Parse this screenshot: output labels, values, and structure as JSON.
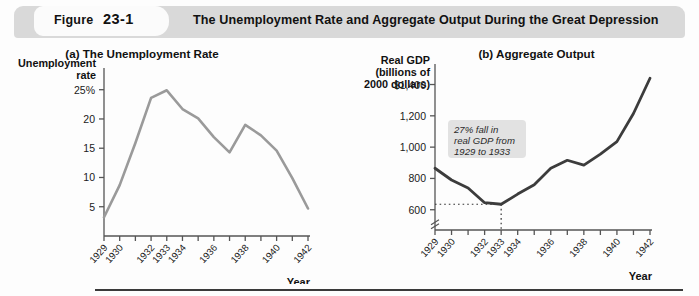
{
  "header": {
    "figure_label": "Figure",
    "figure_number": "23-1",
    "title": "The Unemployment Rate and Aggregate Output During the Great Depression"
  },
  "panel_a": {
    "title": "(a) The Unemployment Rate",
    "y_axis_title_line1": "Unemployment",
    "y_axis_title_line2": "rate",
    "x_axis_title": "Year"
  },
  "panel_b": {
    "title": "(b) Aggregate Output",
    "y_axis_title_line1": "Real GDP",
    "y_axis_title_line2": "(billions of",
    "y_axis_title_line3": "2000 dollars)",
    "x_axis_title": "Year",
    "annotation_line1": "27% fall in",
    "annotation_line2": "real GDP from",
    "annotation_line3": "1929 to 1933"
  },
  "colors": {
    "header_bar": "#d9d9d9",
    "unemployment_line": "#9a9a9a",
    "gdp_line": "#3c3c3c",
    "annotation_box": "#e2e2e2",
    "axis": "#555555",
    "rule": "#3a3a3a"
  },
  "chart_data": [
    {
      "type": "line",
      "id": "unemployment-rate",
      "title": "(a) The Unemployment Rate",
      "xlabel": "Year",
      "ylabel": "Unemployment rate",
      "x": [
        1929,
        1930,
        1931,
        1932,
        1933,
        1934,
        1935,
        1936,
        1937,
        1938,
        1939,
        1940,
        1941,
        1942
      ],
      "values": [
        3.2,
        8.7,
        15.9,
        23.6,
        24.9,
        21.7,
        20.1,
        16.9,
        14.3,
        19.0,
        17.2,
        14.6,
        9.9,
        4.7
      ],
      "ytick_labels": [
        "25%",
        "20",
        "15",
        "10",
        "5"
      ],
      "yticks": [
        25,
        20,
        15,
        10,
        5
      ],
      "ylim": [
        0,
        27
      ],
      "xtick_labels": [
        "1929",
        "1930",
        "1932",
        "1933",
        "1934",
        "1936",
        "1938",
        "1940",
        "1942"
      ],
      "xticks": [
        1929,
        1930,
        1932,
        1933,
        1934,
        1936,
        1938,
        1940,
        1942
      ],
      "grid": false,
      "legend": "none"
    },
    {
      "type": "line",
      "id": "aggregate-output",
      "title": "(b) Aggregate Output",
      "xlabel": "Year",
      "ylabel": "Real GDP (billions of 2000 dollars)",
      "x": [
        1929,
        1930,
        1931,
        1932,
        1933,
        1934,
        1935,
        1936,
        1937,
        1938,
        1939,
        1940,
        1941,
        1942
      ],
      "values": [
        865,
        790,
        739,
        645,
        635,
        700,
        760,
        865,
        916,
        885,
        955,
        1035,
        1215,
        1440
      ],
      "ytick_labels": [
        "$1,400",
        "1,200",
        "1,000",
        "800",
        "600"
      ],
      "yticks": [
        1400,
        1200,
        1000,
        800,
        600
      ],
      "ylim": [
        560,
        1480
      ],
      "axis_break": true,
      "reference_line_value": 635,
      "reference_line_to_year": 1933,
      "xtick_labels": [
        "1929",
        "1930",
        "1932",
        "1933",
        "1934",
        "1936",
        "1938",
        "1940",
        "1942"
      ],
      "xticks": [
        1929,
        1930,
        1932,
        1933,
        1934,
        1936,
        1938,
        1940,
        1942
      ],
      "grid": false,
      "legend": "none",
      "annotation": "27% fall in real GDP from 1929 to 1933"
    }
  ]
}
